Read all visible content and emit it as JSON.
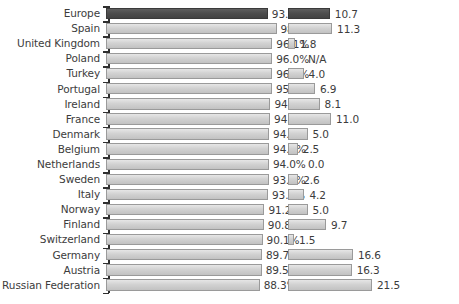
{
  "chart_data": {
    "type": "bar",
    "title": "",
    "subtitle": "",
    "xlabel": "",
    "ylabel": "",
    "orientation": "horizontal",
    "grid": false,
    "legend_position": "none",
    "categories": [
      "Europe",
      "Spain",
      "United Kingdom",
      "Poland",
      "Turkey",
      "Portugal",
      "Ireland",
      "France",
      "Denmark",
      "Belgium",
      "Netherlands",
      "Sweden",
      "Italy",
      "Norway",
      "Finland",
      "Switzerland",
      "Germany",
      "Austria",
      "Russian Federation"
    ],
    "highlighted_category": "Europe",
    "series": [
      {
        "name": "percentage",
        "panel": 1,
        "unit": "%",
        "axis_baseline": 86.0,
        "axis_max": 99.6,
        "values": [
          93.3,
          98.7,
          96.1,
          96.0,
          96.0,
          95.8,
          94.9,
          94.7,
          94.1,
          94.1,
          94.0,
          93.9,
          93.4,
          91.2,
          90.8,
          90.1,
          89.7,
          89.5,
          88.3
        ],
        "labels": [
          "93.3%",
          "98.7%",
          "96.1%",
          "96.0%",
          "96.0%",
          "95.8%",
          "94.9%",
          "94.7%",
          "94.1%",
          "94.1%",
          "94.0%",
          "93.9%",
          "93.4%",
          "91.2%",
          "90.8%",
          "90.1%",
          "89.7%",
          "89.5%",
          "88.3%"
        ]
      },
      {
        "name": "value",
        "panel": 2,
        "unit": "",
        "axis_baseline": 0.0,
        "axis_max": 21.5,
        "values": [
          10.7,
          11.3,
          1.8,
          null,
          4.0,
          6.9,
          8.1,
          11.0,
          5.0,
          2.5,
          0.0,
          2.6,
          4.2,
          5.0,
          9.7,
          1.5,
          16.6,
          16.3,
          21.5
        ],
        "labels": [
          "10.7",
          "11.3",
          "1.8",
          "N/A",
          "4.0",
          "6.9",
          "8.1",
          "11.0",
          "5.0",
          "2.5",
          "0.0",
          "2.6",
          "4.2",
          "5.0",
          "9.7",
          "1.5",
          "16.6",
          "16.3",
          "21.5"
        ]
      }
    ]
  },
  "colors": {
    "bar_fill": "#d2d2d2",
    "bar_border": "#9a9a9a",
    "highlight_fill": "#4e4e4e",
    "highlight_border": "#3a3a3a",
    "text": "#3c3c3c",
    "axis": "#2f2f2f",
    "background": "#ffffff"
  }
}
